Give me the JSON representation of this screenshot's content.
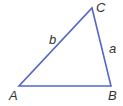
{
  "diagram": {
    "type": "triangle",
    "stroke_color": "#5466c8",
    "vertices": {
      "A": {
        "label": "A",
        "x": 19,
        "y": 86
      },
      "B": {
        "label": "B",
        "x": 111,
        "y": 86
      },
      "C": {
        "label": "C",
        "x": 92,
        "y": 8
      }
    },
    "sides": {
      "a": {
        "label": "a",
        "between": "B-C"
      },
      "b": {
        "label": "b",
        "between": "A-C"
      }
    }
  }
}
